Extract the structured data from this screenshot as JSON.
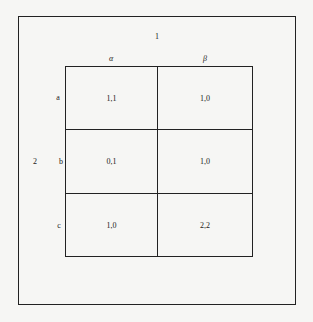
{
  "figure": {
    "player1_label": "1",
    "player2_label": "2",
    "columns": [
      "α",
      "β"
    ],
    "rows": [
      "a",
      "b",
      "c"
    ],
    "payoffs": [
      [
        "1,1",
        "1,0"
      ],
      [
        "0,1",
        "1,0"
      ],
      [
        "1,0",
        "2,2"
      ]
    ]
  }
}
